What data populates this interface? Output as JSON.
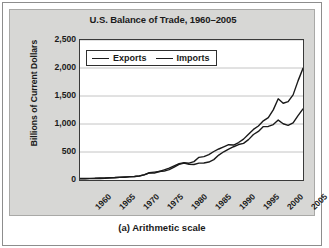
{
  "figure": {
    "caption": "(a) Arithmetic scale"
  },
  "chart_data": {
    "type": "line",
    "title": "U.S. Balance of Trade, 1960–2005",
    "xlabel": "",
    "ylabel": "Billions of Current Dollars",
    "xlim": [
      1960,
      2005
    ],
    "ylim": [
      0,
      2500
    ],
    "ytick_labels": [
      "2,500",
      "2,000",
      "1,500",
      "1,000",
      "500",
      "0"
    ],
    "ytick_values": [
      2500,
      2000,
      1500,
      1000,
      500,
      0
    ],
    "xtick_labels": [
      "1960",
      "1965",
      "1970",
      "1975",
      "1980",
      "1985",
      "1990",
      "1995",
      "2000",
      "2005"
    ],
    "xtick_values": [
      1960,
      1965,
      1970,
      1975,
      1980,
      1985,
      1990,
      1995,
      2000,
      2005
    ],
    "minor_xtick_interval": 1,
    "grid": "horizontal",
    "legend_position": "upper-left-inside",
    "colors": {
      "exports": "#1a1a1a",
      "imports": "#1a1a1a",
      "plot_background": "#ffffff",
      "panel_background": "#d7d7d5",
      "gridline": "#b5b5b5",
      "axis": "#3a3a3a"
    },
    "x": [
      1960,
      1961,
      1962,
      1963,
      1964,
      1965,
      1966,
      1967,
      1968,
      1969,
      1970,
      1971,
      1972,
      1973,
      1974,
      1975,
      1976,
      1977,
      1978,
      1979,
      1980,
      1981,
      1982,
      1983,
      1984,
      1985,
      1986,
      1987,
      1988,
      1989,
      1990,
      1991,
      1992,
      1993,
      1994,
      1995,
      1996,
      1997,
      1998,
      1999,
      2000,
      2001,
      2002,
      2003,
      2004,
      2005
    ],
    "series": [
      {
        "name": "Exports",
        "values": [
          26,
          27,
          29,
          31,
          36,
          38,
          42,
          44,
          48,
          53,
          60,
          63,
          71,
          96,
          129,
          141,
          152,
          159,
          186,
          231,
          279,
          302,
          282,
          277,
          302,
          303,
          321,
          364,
          445,
          504,
          552,
          594,
          633,
          655,
          721,
          812,
          868,
          954,
          956,
          990,
          1070,
          1005,
          975,
          1020,
          1150,
          1270
        ],
        "label_year_peak": 2000,
        "note_2005_value": 1270
      },
      {
        "name": "Imports",
        "values": [
          22,
          22,
          25,
          26,
          28,
          31,
          36,
          39,
          46,
          50,
          55,
          62,
          74,
          91,
          127,
          122,
          151,
          182,
          212,
          252,
          291,
          310,
          300,
          328,
          405,
          417,
          453,
          509,
          554,
          591,
          630,
          624,
          669,
          730,
          819,
          903,
          965,
          1056,
          1115,
          1252,
          1450,
          1370,
          1400,
          1520,
          1770,
          1995
        ],
        "label_year_peak": 2000,
        "note_2005_value": 1995
      }
    ],
    "legend": [
      {
        "label": "Exports",
        "swatch": "line-swatch-exports"
      },
      {
        "label": "Imports",
        "swatch": "line-swatch-imports"
      }
    ]
  }
}
